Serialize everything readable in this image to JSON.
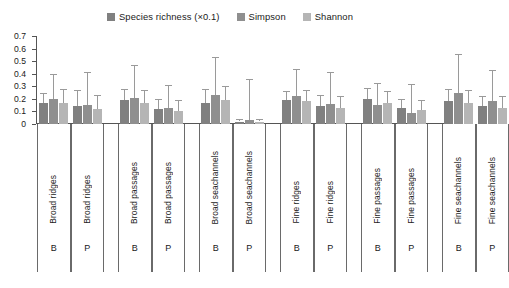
{
  "chart_data": {
    "type": "bar",
    "title": "",
    "xlabel": "",
    "ylabel": "",
    "ylim": [
      0,
      0.7
    ],
    "ytick_labels": [
      "0.7",
      "0.6",
      "0.5",
      "0.4",
      "0.3",
      "0.2",
      "0.1",
      "0"
    ],
    "ytick_values": [
      0.7,
      0.6,
      0.5,
      0.4,
      0.3,
      0.2,
      0.1,
      0
    ],
    "grid": false,
    "legend_position": "top-center",
    "legend": [
      {
        "label": "Species richness (×0.1)",
        "color": "#808080"
      },
      {
        "label": "Simpson",
        "color": "#8f8f8f"
      },
      {
        "label": "Shannon",
        "color": "#b5b5b5"
      }
    ],
    "categories": [
      "Broad ridges",
      "Broad ridges",
      "Broad passages",
      "Broad passages",
      "Broad seachannels",
      "Broad seachannels",
      "Fine ridges",
      "Fine ridges",
      "Fine passages",
      "Fine passages",
      "Fine seachannels",
      "Fine seachannels"
    ],
    "subgroup_labels": [
      "B",
      "P",
      "B",
      "P",
      "B",
      "P",
      "B",
      "P",
      "B",
      "P",
      "B",
      "P"
    ],
    "series": [
      {
        "name": "Species richness (×0.1)",
        "color": "#808080",
        "values": [
          0.17,
          0.14,
          0.19,
          0.12,
          0.17,
          0.02,
          0.19,
          0.14,
          0.2,
          0.13,
          0.18,
          0.14
        ],
        "errors": [
          0.08,
          0.13,
          0.09,
          0.08,
          0.11,
          0.02,
          0.07,
          0.09,
          0.09,
          0.07,
          0.1,
          0.08
        ]
      },
      {
        "name": "Simpson",
        "color": "#8f8f8f",
        "values": [
          0.2,
          0.15,
          0.21,
          0.13,
          0.23,
          0.03,
          0.22,
          0.16,
          0.15,
          0.09,
          0.25,
          0.18
        ],
        "errors": [
          0.2,
          0.26,
          0.26,
          0.18,
          0.3,
          0.33,
          0.22,
          0.25,
          0.18,
          0.23,
          0.31,
          0.25
        ]
      },
      {
        "name": "Shannon",
        "color": "#b5b5b5",
        "values": [
          0.17,
          0.12,
          0.17,
          0.1,
          0.19,
          0.02,
          0.18,
          0.13,
          0.17,
          0.11,
          0.17,
          0.13
        ],
        "errors": [
          0.11,
          0.11,
          0.1,
          0.09,
          0.11,
          0.02,
          0.09,
          0.09,
          0.09,
          0.08,
          0.1,
          0.09
        ]
      }
    ]
  }
}
